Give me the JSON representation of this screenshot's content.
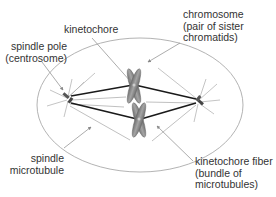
{
  "diagram": {
    "labels": {
      "kinetochore": "kinetochore",
      "spindle_pole": [
        "spindle pole",
        "(centrosome)"
      ],
      "chromosome": [
        "chromosome",
        "(pair of sister",
        "chromatids)"
      ],
      "spindle_microtubule": [
        "spindle",
        "microtubule"
      ],
      "kinetochore_fiber": [
        "kinetochore fiber",
        "(bundle of",
        "microtubules)"
      ]
    },
    "colors": {
      "cell_outline": "#9a9a9a",
      "chromosome_fill": "#8a8a8a",
      "kinetochore_fiber": "#1a1a1a",
      "microtubule": "#b0b0b0",
      "leader_line": "#888888",
      "text": "#333333"
    }
  }
}
